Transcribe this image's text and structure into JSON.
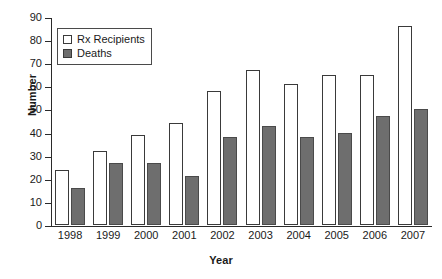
{
  "chart_data": {
    "type": "bar",
    "title": "",
    "xlabel": "Year",
    "ylabel": "Number",
    "categories": [
      "1998",
      "1999",
      "2000",
      "2001",
      "2002",
      "2003",
      "2004",
      "2005",
      "2006",
      "2007"
    ],
    "series": [
      {
        "name": "Rx Recipients",
        "color": "#ffffff",
        "values": [
          24,
          32,
          39,
          44,
          58,
          67,
          61,
          65,
          65,
          86
        ]
      },
      {
        "name": "Deaths",
        "color": "#6e6e6e",
        "values": [
          16,
          27,
          27,
          21,
          38,
          43,
          38,
          40,
          47,
          50
        ]
      }
    ],
    "ylim": [
      0,
      90
    ],
    "yticks": [
      0,
      10,
      20,
      30,
      40,
      50,
      60,
      70,
      80,
      90
    ],
    "ytick_labels": [
      "0",
      "10",
      "20",
      "30",
      "40",
      "50",
      "60",
      "70",
      "80",
      "90"
    ],
    "grid": false,
    "legend_position": "upper-left",
    "legend_entries": [
      "Rx Recipients",
      "Deaths"
    ]
  }
}
